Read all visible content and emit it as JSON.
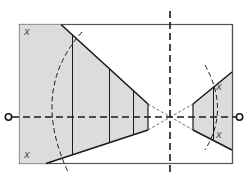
{
  "diagram": {
    "type": "optical-ray-diagram",
    "colors": {
      "stroke": "#1a1a1a",
      "shade": "#dcdcdc",
      "frame": "#555555",
      "background": "#ffffff"
    },
    "labels": {
      "top_left": "x",
      "bottom_left": "x",
      "right_upper": "x",
      "right_lower": "x"
    },
    "elements": {
      "frame": "rectangle",
      "optical_axis": "horizontal dashed line with circle endpoints",
      "center_axis": "vertical dashed line",
      "left_region": "shaded trapezoid with three vertical dividers",
      "right_region": "shaded trapezoid with one vertical divider",
      "arcs": "two dashed arcs"
    }
  }
}
